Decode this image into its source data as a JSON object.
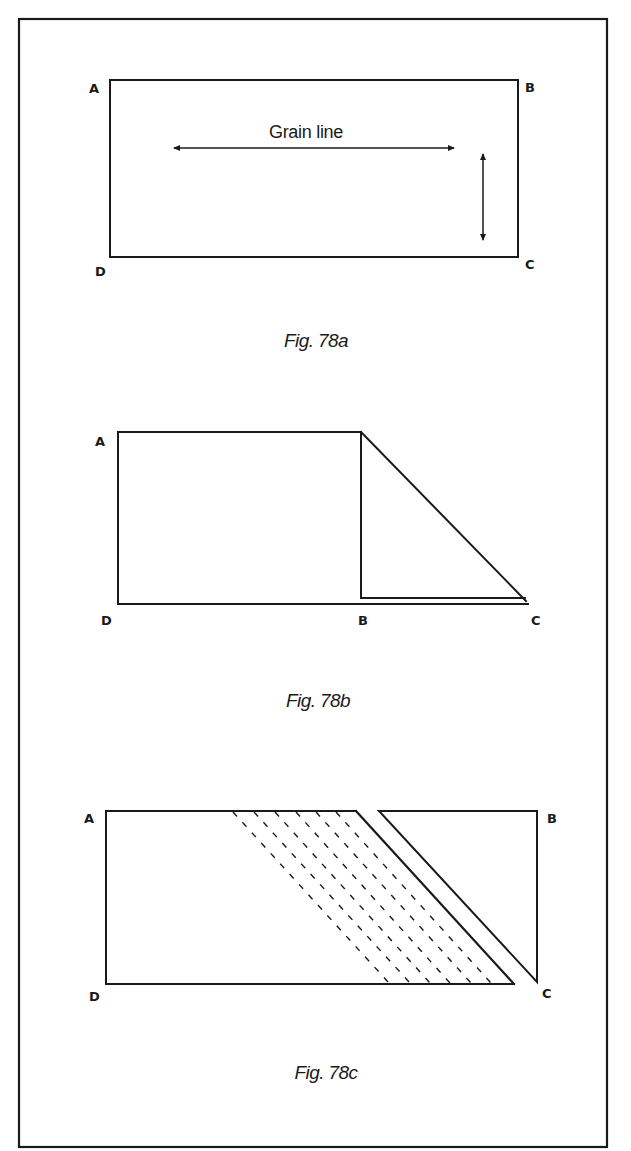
{
  "figures": [
    {
      "id": "78a",
      "caption": "Fig. 78a",
      "annotation": "Grain line",
      "corners": {
        "a": "A",
        "b": "B",
        "c": "C",
        "d": "D"
      }
    },
    {
      "id": "78b",
      "caption": "Fig. 78b",
      "corners": {
        "a": "A",
        "b": "B",
        "c": "C",
        "d": "D"
      }
    },
    {
      "id": "78c",
      "caption": "Fig. 78c",
      "corners": {
        "a": "A",
        "b": "B",
        "c": "C",
        "d": "D"
      }
    }
  ],
  "colors": {
    "ink": "#1a1a1a",
    "paper": "#ffffff"
  }
}
